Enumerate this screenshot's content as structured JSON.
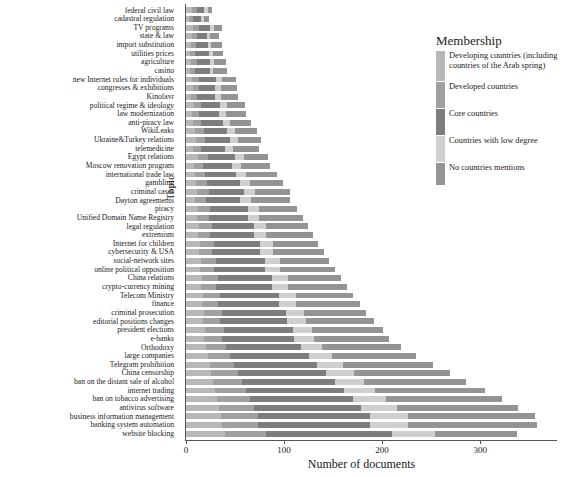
{
  "chart_data": {
    "type": "bar",
    "orientation": "horizontal",
    "stacked": true,
    "title": "",
    "xlabel": "Number of documents",
    "ylabel": "Topic",
    "xlim": [
      0,
      358
    ],
    "xticks": [
      0,
      100,
      200,
      300
    ],
    "grid": false,
    "legend": {
      "title": "Membership",
      "position": "right",
      "entries": [
        {
          "name": "Developing countries (including countries of the Arab spring)",
          "color": "#b8b8b8"
        },
        {
          "name": "Developed countries",
          "color": "#a0a0a0"
        },
        {
          "name": "Core countries",
          "color": "#7d7d7d"
        },
        {
          "name": "Countries with low degree",
          "color": "#cfcfcf"
        },
        {
          "name": "No countries mentions",
          "color": "#949494"
        }
      ]
    },
    "categories": [
      "federal civil law",
      "cadastral regulation",
      "TV programs",
      "state & law",
      "import substitution",
      "utilities prices",
      "agriculture",
      "casino",
      "new Internet rules for individuals",
      "congresses & exhibitions",
      "Kinofavr",
      "political regime & ideology",
      "law modernization",
      "anti-piracy law",
      "WikiLeaks",
      "Ukraine&Turkey relations",
      "telemedicine",
      "Egypt relations",
      "Moscow renovation program",
      "international trade law",
      "gambling",
      "criminal cases",
      "Dayton agreements",
      "piracy",
      "Unified Domain Name Registry",
      "legal regulation",
      "extremism",
      "Internet for children",
      "cybersecurity & USA",
      "social-network sites",
      "online political opposition",
      "China relations",
      "crypto-currency mining",
      "Telecom Ministry",
      "finance",
      "criminal prosecution",
      "editorial positions changes",
      "president elections",
      "e-banks",
      "Orthodoxy",
      "large companies",
      "Telegram prohibition",
      "China censorship",
      "ban on the distant sale of alcohol",
      "internet trading",
      "ban on tobacco advertising",
      "antivirus software",
      "business information management",
      "banking system automation",
      "website blocking"
    ],
    "series": [
      {
        "name": "Developing countries (including countries of the Arab spring)",
        "color": "#b8b8b8",
        "values": [
          6,
          3,
          7,
          6,
          5,
          4,
          5,
          4,
          6,
          7,
          5,
          8,
          6,
          7,
          9,
          10,
          7,
          12,
          8,
          9,
          10,
          11,
          9,
          12,
          11,
          13,
          12,
          14,
          13,
          15,
          14,
          16,
          15,
          17,
          16,
          18,
          17,
          19,
          18,
          20,
          22,
          24,
          26,
          28,
          30,
          32,
          34,
          36,
          38,
          40
        ]
      },
      {
        "name": "Developed countries",
        "color": "#a0a0a0",
        "values": [
          5,
          4,
          6,
          5,
          5,
          5,
          6,
          5,
          7,
          6,
          6,
          7,
          7,
          8,
          9,
          9,
          8,
          10,
          9,
          10,
          11,
          12,
          11,
          13,
          12,
          14,
          13,
          15,
          14,
          16,
          15,
          17,
          16,
          18,
          17,
          19,
          18,
          20,
          19,
          21,
          23,
          25,
          27,
          29,
          31,
          33,
          35,
          37,
          39,
          42
        ]
      },
      {
        "name": "Core countries",
        "color": "#7d7d7d",
        "values": [
          7,
          8,
          11,
          10,
          12,
          14,
          13,
          15,
          18,
          17,
          19,
          20,
          21,
          23,
          24,
          26,
          25,
          28,
          30,
          32,
          34,
          36,
          35,
          38,
          40,
          42,
          44,
          46,
          48,
          50,
          52,
          55,
          57,
          60,
          62,
          65,
          68,
          70,
          73,
          76,
          80,
          85,
          90,
          95,
          100,
          105,
          110,
          115,
          120,
          128
        ]
      },
      {
        "name": "Countries with low degree",
        "color": "#cfcfcf",
        "values": [
          4,
          3,
          5,
          4,
          4,
          5,
          5,
          4,
          6,
          6,
          6,
          7,
          7,
          7,
          8,
          8,
          8,
          9,
          9,
          10,
          10,
          11,
          11,
          12,
          12,
          13,
          13,
          14,
          14,
          15,
          15,
          16,
          16,
          17,
          17,
          18,
          19,
          20,
          21,
          22,
          24,
          26,
          28,
          30,
          32,
          34,
          36,
          38,
          40,
          44
        ]
      },
      {
        "name": "No countries mentions",
        "color": "#949494"
      }
    ],
    "no_mentions_values": [
      5,
      5,
      8,
      9,
      11,
      10,
      12,
      14,
      14,
      16,
      17,
      18,
      20,
      21,
      22,
      24,
      27,
      25,
      30,
      32,
      34,
      36,
      40,
      38,
      44,
      42,
      48,
      46,
      52,
      50,
      56,
      54,
      60,
      58,
      66,
      64,
      70,
      72,
      76,
      80,
      86,
      92,
      98,
      104,
      112,
      118,
      124,
      130,
      138,
      84
    ],
    "totals": [
      27,
      23,
      37,
      34,
      37,
      38,
      41,
      42,
      51,
      52,
      53,
      60,
      61,
      66,
      72,
      77,
      75,
      84,
      86,
      93,
      99,
      106,
      106,
      113,
      119,
      124,
      130,
      135,
      141,
      146,
      152,
      158,
      164,
      170,
      178,
      184,
      192,
      201,
      207,
      219,
      235,
      252,
      269,
      286,
      305,
      322,
      339,
      356,
      375,
      338
    ]
  },
  "axis": {
    "ytitle": "Topic",
    "xtitle": "Number of documents",
    "xticklabels": [
      "0",
      "100",
      "200",
      "300"
    ]
  }
}
